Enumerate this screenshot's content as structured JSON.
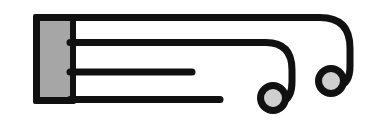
{
  "colors": {
    "background": "#ffffff",
    "stroke": "#111111",
    "block_fill": "#a6a6a6",
    "terminal_fill": "#cfcfcf"
  },
  "elements": {
    "block": {
      "label": "block"
    },
    "lines": [
      {
        "label": "line-1",
        "terminal": "looped-circle"
      },
      {
        "label": "line-2",
        "terminal": "looped-circle"
      },
      {
        "label": "line-3",
        "terminal": "none"
      },
      {
        "label": "line-4",
        "terminal": "none"
      }
    ]
  }
}
